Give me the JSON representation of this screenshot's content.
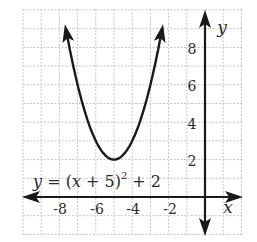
{
  "chart_data": {
    "type": "line",
    "title": "",
    "equation": "y = (x + 5)^2 + 2",
    "equation_parts": {
      "y": "y",
      "eq": " = (",
      "x": "x",
      "rest": " + 5)",
      "sup": "2",
      "tail": " + 2"
    },
    "function": "(x+5)^2+2",
    "vertex": [
      -5,
      2
    ],
    "xlabel": "x",
    "ylabel": "y",
    "xlim": [
      -10,
      2
    ],
    "ylim": [
      -2,
      10
    ],
    "x_ticks": [
      -8,
      -6,
      -4,
      -2
    ],
    "x_tick_labels": [
      "-8",
      "-6",
      "-4",
      "-2"
    ],
    "y_ticks": [
      2,
      4,
      6,
      8
    ],
    "y_tick_labels": [
      "2",
      "4",
      "6",
      "8"
    ],
    "grid": true,
    "grid_style": "dashed",
    "series": [
      {
        "name": "y = (x + 5)^2 + 2",
        "x": [
          -7.8,
          -7.5,
          -7,
          -6.5,
          -6,
          -5.5,
          -5,
          -4.5,
          -4,
          -3.5,
          -3,
          -2.5,
          -2.2
        ],
        "y": [
          9.84,
          8.25,
          6,
          4.25,
          3,
          2.25,
          2,
          2.25,
          3,
          4.25,
          6,
          8.25,
          9.84
        ]
      }
    ],
    "colors": {
      "curve": "#1a1a1a",
      "axes": "#1a1a1a",
      "grid": "#c4c4c4",
      "background": "#ffffff"
    }
  }
}
